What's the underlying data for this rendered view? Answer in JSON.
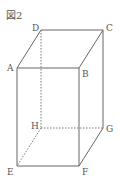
{
  "figure": {
    "title": "図2",
    "type": "rectangular prism (cuboid)",
    "line_color": "#666666",
    "hidden_line_style": "dotted",
    "vertices": {
      "A": {
        "label": "A",
        "x": 17,
        "y": 68
      },
      "B": {
        "label": "B",
        "x": 79,
        "y": 68
      },
      "C": {
        "label": "C",
        "x": 103,
        "y": 30
      },
      "D": {
        "label": "D",
        "x": 41,
        "y": 30
      },
      "E": {
        "label": "E",
        "x": 17,
        "y": 166
      },
      "F": {
        "label": "F",
        "x": 79,
        "y": 166
      },
      "G": {
        "label": "G",
        "x": 103,
        "y": 128
      },
      "H": {
        "label": "H",
        "x": 41,
        "y": 128
      }
    },
    "visible_edges": [
      "AB",
      "BC",
      "CD",
      "DA",
      "AE",
      "BF",
      "CG",
      "EF",
      "FG"
    ],
    "hidden_edges": [
      "DH",
      "HE",
      "HG"
    ]
  }
}
